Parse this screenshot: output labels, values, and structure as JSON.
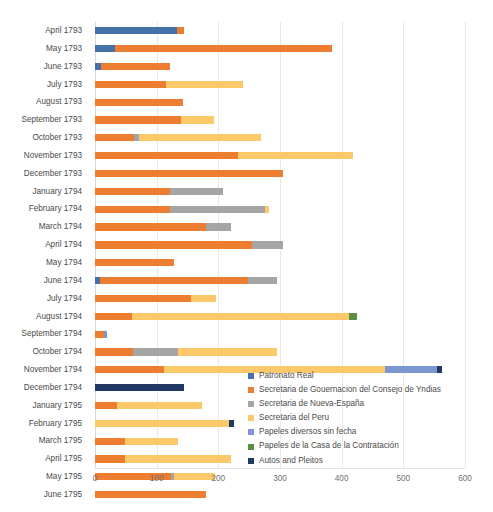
{
  "chart_data": {
    "type": "bar",
    "orientation": "horizontal",
    "stacked": true,
    "title": "",
    "xlabel": "",
    "ylabel": "",
    "xlim": [
      0,
      600
    ],
    "xticks": [
      0,
      100,
      200,
      300,
      400,
      500,
      600
    ],
    "grid": "vertical",
    "legend_position": "inside-bottom-right",
    "categories": [
      "April 1793",
      "May 1793",
      "June 1793",
      "July 1793",
      "August 1793",
      "September 1793",
      "October 1793",
      "November 1793",
      "December 1793",
      "January 1794",
      "February 1794",
      "March 1794",
      "April 1794",
      "May 1794",
      "June 1794",
      "July 1794",
      "August 1794",
      "September 1794",
      "October 1794",
      "November 1794",
      "December 1794",
      "January 1795",
      "February 1795",
      "March 1795",
      "April 1795",
      "May 1795",
      "June 1795"
    ],
    "series": [
      {
        "name": "Patronato Real",
        "color": "#4472a8",
        "values": [
          133,
          33,
          10,
          0,
          0,
          0,
          0,
          0,
          0,
          0,
          0,
          0,
          0,
          0,
          8,
          0,
          0,
          0,
          0,
          0,
          0,
          0,
          0,
          0,
          0,
          0,
          0
        ]
      },
      {
        "name": "Secretaria de Gouernacion del Consejo de Yndias",
        "color": "#ed7d31",
        "values": [
          12,
          352,
          112,
          115,
          143,
          140,
          63,
          232,
          305,
          122,
          122,
          180,
          255,
          128,
          240,
          155,
          60,
          15,
          62,
          112,
          0,
          35,
          0,
          48,
          48,
          123,
          180
        ]
      },
      {
        "name": "Secretaria de Nueva-España",
        "color": "#a5a5a5",
        "values": [
          0,
          0,
          0,
          0,
          0,
          0,
          9,
          0,
          0,
          85,
          153,
          40,
          50,
          0,
          47,
          0,
          0,
          0,
          73,
          0,
          0,
          0,
          0,
          0,
          0,
          5,
          0
        ]
      },
      {
        "name": "Secretaria del Peru",
        "color": "#fbc96a",
        "values": [
          0,
          0,
          0,
          125,
          0,
          53,
          198,
          186,
          0,
          0,
          8,
          0,
          0,
          0,
          0,
          41,
          352,
          0,
          160,
          358,
          0,
          138,
          218,
          87,
          172,
          67,
          0
        ]
      },
      {
        "name": "Papeles diversos sin fecha",
        "color": "#7b97d1",
        "values": [
          0,
          0,
          0,
          0,
          0,
          0,
          0,
          0,
          0,
          0,
          0,
          0,
          0,
          0,
          0,
          0,
          0,
          5,
          0,
          85,
          0,
          0,
          0,
          0,
          0,
          0,
          0
        ]
      },
      {
        "name": "Papeles de la Casa de la Contratación",
        "color": "#5b9044",
        "values": [
          0,
          0,
          0,
          0,
          0,
          0,
          0,
          0,
          0,
          0,
          0,
          0,
          0,
          0,
          0,
          0,
          13,
          0,
          0,
          0,
          0,
          0,
          0,
          0,
          0,
          0,
          0
        ]
      },
      {
        "name": "Autos and Pleitos",
        "color": "#1f3864",
        "values": [
          0,
          0,
          0,
          0,
          0,
          0,
          0,
          0,
          0,
          0,
          0,
          0,
          0,
          0,
          0,
          0,
          0,
          0,
          0,
          7,
          145,
          0,
          7,
          0,
          0,
          0,
          0
        ]
      }
    ]
  }
}
